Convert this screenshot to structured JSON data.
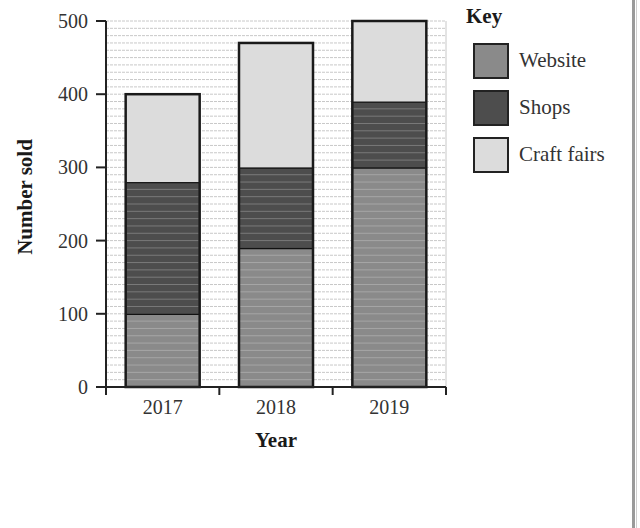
{
  "chart_data": {
    "type": "bar",
    "stacked": true,
    "title": "",
    "xlabel": "Year",
    "ylabel": "Number sold",
    "categories": [
      "2017",
      "2018",
      "2019"
    ],
    "series": [
      {
        "name": "Website",
        "values": [
          100,
          190,
          300
        ],
        "color": "#8a8a8a"
      },
      {
        "name": "Shops",
        "values": [
          180,
          110,
          90
        ],
        "color": "#4d4d4d"
      },
      {
        "name": "Craft fairs",
        "values": [
          120,
          170,
          110
        ],
        "color": "#dcdcdc"
      }
    ],
    "totals": [
      400,
      470,
      500
    ],
    "ylim": [
      0,
      500
    ],
    "yticks": [
      "0",
      "100",
      "200",
      "300",
      "400",
      "500"
    ],
    "grid": true,
    "grid_minor_step": 10,
    "legend_position": "right",
    "legend_title": "Key"
  },
  "legend": {
    "title": "Key",
    "items": [
      {
        "label": "Website",
        "color": "#8a8a8a"
      },
      {
        "label": "Shops",
        "color": "#4d4d4d"
      },
      {
        "label": "Craft fairs",
        "color": "#dcdcdc"
      }
    ]
  },
  "axes": {
    "x_title": "Year",
    "y_title": "Number sold",
    "x_ticks": [
      "2017",
      "2018",
      "2019"
    ],
    "y_ticks": [
      "0",
      "100",
      "200",
      "300",
      "400",
      "500"
    ]
  }
}
